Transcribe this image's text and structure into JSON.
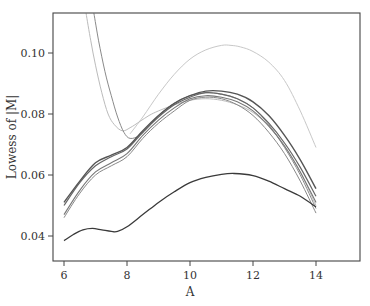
{
  "chart_data": {
    "type": "line",
    "title": "",
    "xlabel": "A",
    "ylabel": "Lowess of |M|",
    "xlim": [
      5.6,
      15.3
    ],
    "ylim": [
      0.032,
      0.113
    ],
    "xticks": [
      6,
      8,
      10,
      12,
      14
    ],
    "xtick_labels": [
      "6",
      "8",
      "10",
      "12",
      "14"
    ],
    "yticks": [
      0.04,
      0.06,
      0.08,
      0.1
    ],
    "ytick_labels": [
      "0.04",
      "0.06",
      "0.08",
      "0.10"
    ],
    "grid": false,
    "legend": null,
    "series": [
      {
        "name": "curve-1",
        "color": "#555555",
        "width": 1.4,
        "x": [
          6.0,
          6.5,
          7.0,
          7.5,
          8.0,
          8.5,
          9.0,
          9.5,
          10.0,
          10.5,
          11.0,
          11.5,
          12.0,
          12.5,
          13.0,
          13.5,
          14.0
        ],
        "y": [
          0.051,
          0.058,
          0.064,
          0.0665,
          0.069,
          0.0745,
          0.0795,
          0.0835,
          0.086,
          0.0875,
          0.0875,
          0.0865,
          0.084,
          0.0795,
          0.073,
          0.065,
          0.0555
        ]
      },
      {
        "name": "curve-2",
        "color": "#666666",
        "width": 1.2,
        "x": [
          6.0,
          6.5,
          7.0,
          7.5,
          8.0,
          8.5,
          9.0,
          9.5,
          10.0,
          10.5,
          11.0,
          11.5,
          12.0,
          12.5,
          13.0,
          13.5,
          14.0
        ],
        "y": [
          0.05,
          0.0575,
          0.063,
          0.066,
          0.0685,
          0.074,
          0.079,
          0.083,
          0.0855,
          0.087,
          0.0865,
          0.085,
          0.082,
          0.077,
          0.0705,
          0.0625,
          0.053
        ]
      },
      {
        "name": "curve-3",
        "color": "#777777",
        "width": 1.1,
        "x": [
          6.0,
          6.5,
          7.0,
          7.5,
          8.0,
          8.5,
          9.0,
          9.5,
          10.0,
          10.5,
          11.0,
          11.5,
          12.0,
          12.5,
          13.0,
          13.5,
          14.0
        ],
        "y": [
          0.047,
          0.055,
          0.061,
          0.064,
          0.067,
          0.073,
          0.078,
          0.082,
          0.085,
          0.086,
          0.0855,
          0.084,
          0.081,
          0.076,
          0.0695,
          0.061,
          0.051
        ]
      },
      {
        "name": "curve-4",
        "color": "#888888",
        "width": 1.0,
        "x": [
          6.0,
          6.5,
          7.0,
          7.5,
          8.0,
          8.5,
          9.0,
          9.5,
          10.0,
          10.5,
          11.0,
          11.5,
          12.0,
          12.5,
          13.0,
          13.5,
          14.0
        ],
        "y": [
          0.046,
          0.054,
          0.06,
          0.063,
          0.066,
          0.072,
          0.077,
          0.081,
          0.0845,
          0.0855,
          0.085,
          0.083,
          0.0795,
          0.074,
          0.067,
          0.058,
          0.0475
        ]
      },
      {
        "name": "curve-5-steep",
        "color": "#8a8a8a",
        "width": 1.0,
        "x": [
          6.95,
          7.1,
          7.3,
          7.5,
          7.7,
          7.9,
          8.1,
          8.4,
          8.7,
          9.0,
          9.5,
          10.0,
          10.5,
          11.0,
          11.5,
          12.0,
          12.5,
          13.0,
          13.5,
          14.0
        ],
        "y": [
          0.113,
          0.104,
          0.094,
          0.086,
          0.079,
          0.074,
          0.072,
          0.073,
          0.076,
          0.0795,
          0.0835,
          0.086,
          0.087,
          0.0865,
          0.085,
          0.082,
          0.0765,
          0.069,
          0.06,
          0.049
        ]
      },
      {
        "name": "curve-6-steep-light",
        "color": "#bbbbbb",
        "width": 1.0,
        "x": [
          6.7,
          6.85,
          7.0,
          7.2,
          7.4,
          7.6,
          7.85,
          8.1,
          8.4,
          8.7,
          9.0,
          9.5,
          10.0,
          10.5,
          11.0,
          11.5,
          12.0,
          12.5,
          13.0,
          13.5,
          14.0
        ],
        "y": [
          0.113,
          0.104,
          0.096,
          0.087,
          0.08,
          0.0765,
          0.0745,
          0.0755,
          0.0775,
          0.0795,
          0.081,
          0.083,
          0.0845,
          0.085,
          0.0845,
          0.083,
          0.0805,
          0.076,
          0.0695,
          0.061,
          0.05
        ]
      },
      {
        "name": "curve-7-high-light",
        "color": "#c8c8c8",
        "width": 1.0,
        "x": [
          8.1,
          8.5,
          9.0,
          9.5,
          10.0,
          10.5,
          11.0,
          11.3,
          11.6,
          12.0,
          12.5,
          13.0,
          13.5,
          14.0
        ],
        "y": [
          0.0735,
          0.079,
          0.0865,
          0.093,
          0.098,
          0.101,
          0.1025,
          0.1025,
          0.102,
          0.1005,
          0.097,
          0.091,
          0.081,
          0.069
        ]
      },
      {
        "name": "curve-8-low-dark",
        "color": "#3a3a3a",
        "width": 1.3,
        "x": [
          6.0,
          6.3,
          6.6,
          6.9,
          7.2,
          7.5,
          7.7,
          8.0,
          8.5,
          9.0,
          9.5,
          10.0,
          10.5,
          11.0,
          11.4,
          12.0,
          12.5,
          13.0,
          13.5,
          14.0
        ],
        "y": [
          0.0385,
          0.0405,
          0.042,
          0.0425,
          0.042,
          0.0415,
          0.0415,
          0.043,
          0.047,
          0.051,
          0.0545,
          0.0575,
          0.0592,
          0.0602,
          0.0605,
          0.0598,
          0.058,
          0.0555,
          0.053,
          0.0495
        ]
      }
    ]
  }
}
